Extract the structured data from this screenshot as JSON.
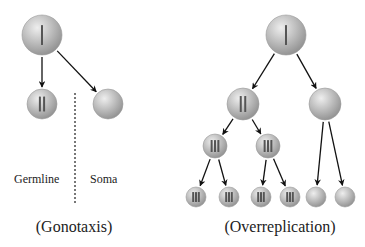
{
  "panels": {
    "gonotaxis": {
      "caption": "(Gonotaxis)",
      "labels": {
        "germline": "Germline",
        "soma": "Soma"
      },
      "cells": [
        {
          "id": "g-root",
          "cx": 42,
          "cy": 35,
          "r": 20,
          "chromosomes": 1
        },
        {
          "id": "g-germline",
          "cx": 42,
          "cy": 104,
          "r": 15,
          "chromosomes": 2
        },
        {
          "id": "g-soma",
          "cx": 108,
          "cy": 104,
          "r": 15,
          "chromosomes": 0
        }
      ],
      "arrows": [
        {
          "from": "g-root",
          "to": "g-germline"
        },
        {
          "from": "g-root",
          "to": "g-soma"
        }
      ],
      "divider": {
        "x": 75,
        "y1": 93,
        "y2": 204
      }
    },
    "overreplication": {
      "caption": "(Overreplication)",
      "cells": [
        {
          "id": "o-root",
          "cx": 286,
          "cy": 35,
          "r": 20,
          "chromosomes": 1
        },
        {
          "id": "o-l1",
          "cx": 243,
          "cy": 104,
          "r": 16,
          "chromosomes": 2
        },
        {
          "id": "o-r1",
          "cx": 325,
          "cy": 104,
          "r": 16,
          "chromosomes": 0
        },
        {
          "id": "o-l2a",
          "cx": 215,
          "cy": 146,
          "r": 12,
          "chromosomes": 3
        },
        {
          "id": "o-l2b",
          "cx": 268,
          "cy": 146,
          "r": 12,
          "chromosomes": 3
        },
        {
          "id": "o-l3a",
          "cx": 196,
          "cy": 197,
          "r": 10,
          "chromosomes": 3
        },
        {
          "id": "o-l3b",
          "cx": 229,
          "cy": 197,
          "r": 10,
          "chromosomes": 3
        },
        {
          "id": "o-l3c",
          "cx": 261,
          "cy": 197,
          "r": 10,
          "chromosomes": 3
        },
        {
          "id": "o-l3d",
          "cx": 290,
          "cy": 197,
          "r": 10,
          "chromosomes": 3
        },
        {
          "id": "o-l3e",
          "cx": 316,
          "cy": 197,
          "r": 10,
          "chromosomes": 0
        },
        {
          "id": "o-l3f",
          "cx": 345,
          "cy": 197,
          "r": 10,
          "chromosomes": 0
        }
      ],
      "arrows": [
        {
          "from": "o-root",
          "to": "o-l1"
        },
        {
          "from": "o-root",
          "to": "o-r1"
        },
        {
          "from": "o-l1",
          "to": "o-l2a"
        },
        {
          "from": "o-l1",
          "to": "o-l2b"
        },
        {
          "from": "o-l2a",
          "to": "o-l3a"
        },
        {
          "from": "o-l2a",
          "to": "o-l3b"
        },
        {
          "from": "o-l2b",
          "to": "o-l3c"
        },
        {
          "from": "o-l2b",
          "to": "o-l3d"
        },
        {
          "from": "o-r1",
          "to": "o-l3e"
        },
        {
          "from": "o-r1",
          "to": "o-l3f"
        }
      ]
    }
  },
  "colors": {
    "cell_light": "#e4e4e4",
    "cell_mid": "#b8b8b8",
    "cell_dark": "#8a8a8a",
    "chromosome": "#555555",
    "arrow": "#111111",
    "divider": "#777777",
    "text": "#222222"
  }
}
